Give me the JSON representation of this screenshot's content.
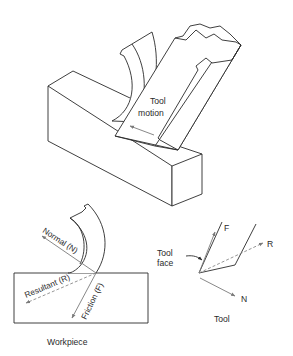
{
  "diagram": {
    "top_view": {
      "tool_motion_label_line1": "Tool",
      "tool_motion_label_line2": "motion"
    },
    "workpiece_view": {
      "normal_label": "Normal (N)",
      "resultant_label": "Resultant (R)",
      "friction_label": "Friction (F)",
      "caption": "Workpiece"
    },
    "tool_view": {
      "tool_face_label_line1": "Tool",
      "tool_face_label_line2": "face",
      "force_f_label": "F",
      "force_r_label": "R",
      "force_n_label": "N",
      "caption": "Tool"
    },
    "colors": {
      "line": "#2a2a2a",
      "arrow": "#7a7a7a",
      "background": "#ffffff"
    }
  }
}
